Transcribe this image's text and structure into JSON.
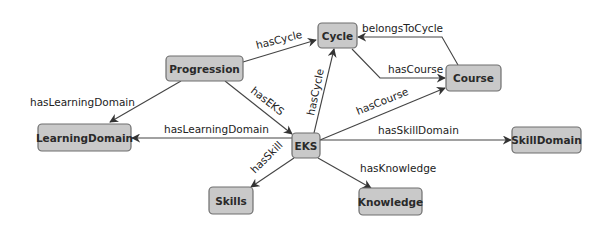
{
  "diagram": {
    "type": "ontology-graph",
    "nodes": {
      "cycle": {
        "label": "Cycle"
      },
      "progression": {
        "label": "Progression"
      },
      "course": {
        "label": "Course"
      },
      "learningdomain": {
        "label": "LearningDomain"
      },
      "eks": {
        "label": "EKS"
      },
      "skilldomain": {
        "label": "SkillDomain"
      },
      "skills": {
        "label": "Skills"
      },
      "knowledge": {
        "label": "Knowledge"
      }
    },
    "edges": {
      "progression_cycle": {
        "label": "hasCycle",
        "from": "Progression",
        "to": "Cycle"
      },
      "progression_learningdomain": {
        "label": "hasLearningDomain",
        "from": "Progression",
        "to": "LearningDomain"
      },
      "progression_eks": {
        "label": "hasEKS",
        "from": "Progression",
        "to": "EKS"
      },
      "course_cycle": {
        "label": "belongsToCycle",
        "from": "Course",
        "to": "Cycle"
      },
      "cycle_course": {
        "label": "hasCourse",
        "from": "Cycle",
        "to": "Course"
      },
      "eks_cycle": {
        "label": "hasCycle",
        "from": "EKS",
        "to": "Cycle"
      },
      "eks_course": {
        "label": "hasCourse",
        "from": "EKS",
        "to": "Course"
      },
      "eks_learningdomain": {
        "label": "hasLearningDomain",
        "from": "EKS",
        "to": "LearningDomain"
      },
      "eks_skilldomain": {
        "label": "hasSkillDomain",
        "from": "EKS",
        "to": "SkillDomain"
      },
      "eks_skills": {
        "label": "hasSkill",
        "from": "EKS",
        "to": "Skills"
      },
      "eks_knowledge": {
        "label": "hasKnowledge",
        "from": "EKS",
        "to": "Knowledge"
      }
    },
    "colors": {
      "node_fill": "#c9c9c9",
      "node_stroke": "#6e6e6e",
      "edge_stroke": "#444444",
      "text": "#222222"
    }
  }
}
